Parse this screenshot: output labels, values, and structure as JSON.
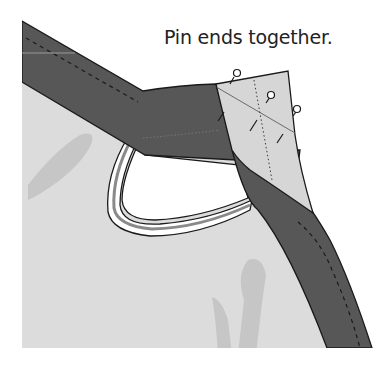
{
  "caption": "Pin ends together.",
  "colors": {
    "background": "#ffffff",
    "fabric": "#dcdcdc",
    "fabric_shadow": "#c4c4c4",
    "binding_dark": "#575757",
    "binding_light": "#d6d6d6",
    "outline": "#1a1a1a",
    "armhole": "#ffffff"
  },
  "illustration": {
    "subject": "bias binding ends pinned together at garment armhole/neckline",
    "pins_count": 3
  }
}
